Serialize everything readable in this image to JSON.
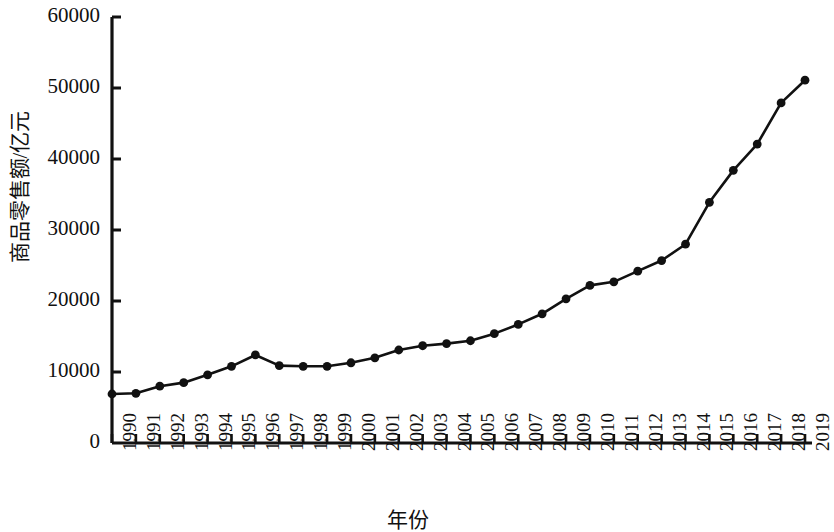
{
  "chart_data": {
    "type": "line",
    "title": "",
    "subtitle": "",
    "xlabel": "年份",
    "ylabel": "商品零售额/亿元",
    "grid": false,
    "legend": null,
    "legend_position": "none",
    "marker": "filled-circle",
    "line_color": "#111111",
    "marker_color": "#111111",
    "xlim": [
      1990,
      2019
    ],
    "ylim": [
      0,
      60000
    ],
    "ytick_labels": [
      "0",
      "10000",
      "20000",
      "30000",
      "40000",
      "50000",
      "60000"
    ],
    "ytick_values": [
      0,
      10000,
      20000,
      30000,
      40000,
      50000,
      60000
    ],
    "categories": [
      "1990",
      "1991",
      "1992",
      "1993",
      "1994",
      "1995",
      "1996",
      "1997",
      "1998",
      "1999",
      "2000",
      "2001",
      "2002",
      "2003",
      "2004",
      "2005",
      "2006",
      "2007",
      "2008",
      "2009",
      "2010",
      "2011",
      "2012",
      "2013",
      "2014",
      "2015",
      "2016",
      "2017",
      "2018",
      "2019"
    ],
    "values": [
      6900,
      7000,
      8000,
      8500,
      9600,
      10800,
      12400,
      10900,
      10800,
      10800,
      11300,
      12000,
      13100,
      13700,
      14000,
      14400,
      15400,
      16700,
      18200,
      20300,
      22200,
      22700,
      24200,
      25700,
      28000,
      33900,
      38400,
      42100,
      47900,
      51100
    ]
  }
}
